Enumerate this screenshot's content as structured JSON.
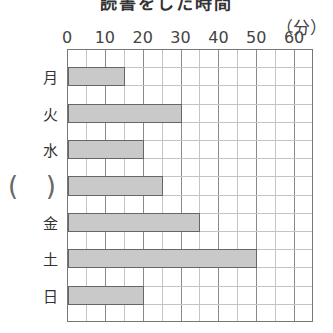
{
  "chart_data": {
    "type": "bar",
    "orientation": "horizontal",
    "title": "読書をした時間",
    "unit": "(分)",
    "xlabel": "(分)",
    "ylabel": "",
    "xlim": [
      0,
      65
    ],
    "xticks": [
      "0",
      "10",
      "20",
      "30",
      "40",
      "50",
      "60"
    ],
    "grid": true,
    "grid_minor_step": 5,
    "grid_major_step": 10,
    "categories": [
      "月",
      "火",
      "水",
      "(  )",
      "金",
      "土",
      "日"
    ],
    "values": [
      15,
      30,
      20,
      25,
      35,
      50,
      20
    ],
    "blank_category_index": 3,
    "colors": {
      "bar_fill": "#c9c9c9",
      "bar_border": "#666666",
      "grid_minor": "#c4c4c4",
      "grid_major": "#8a8a8a"
    }
  },
  "labels": {
    "title": "読書をした時間",
    "unit": "（分）",
    "blank_open": "(",
    "blank_close": ")"
  }
}
